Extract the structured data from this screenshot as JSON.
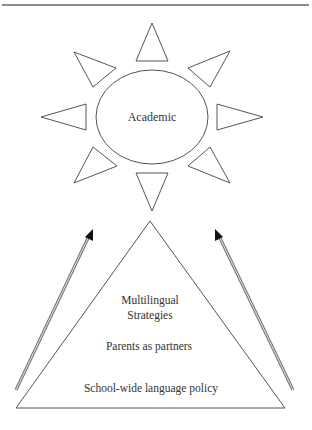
{
  "diagram": {
    "sun": {
      "center_label": "Academic",
      "ray_count": 8
    },
    "pyramid": {
      "levels": [
        {
          "lines": [
            "Multilingual",
            "Strategies"
          ]
        },
        {
          "lines": [
            "Parents as partners"
          ]
        },
        {
          "lines": [
            "School-wide language policy"
          ]
        }
      ]
    },
    "arrows": [
      {
        "side": "left",
        "direction": "up-right"
      },
      {
        "side": "right",
        "direction": "up-left"
      }
    ],
    "colors": {
      "line": "#555555",
      "text": "#333333",
      "arrowhead": "#111111",
      "arrow_shaft": "#777777",
      "background": "#ffffff"
    }
  }
}
